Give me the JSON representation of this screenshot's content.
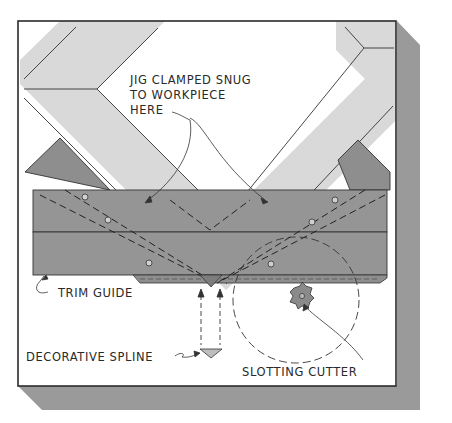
{
  "figure": {
    "type": "technical-illustration"
  },
  "colors": {
    "background": "#ffffff",
    "panel": "#ffffff",
    "panel_border": "#2b2b2b",
    "shadow": "#9a9a9a",
    "workpiece": "#d8d8d8",
    "jig_plate_back": "#8c8c8c",
    "jig_body": "#939393",
    "line": "#333333",
    "spline": "#b8b8b8"
  },
  "labels": {
    "clamp_line1": "JIG CLAMPED SNUG",
    "clamp_line2": "TO WORKPIECE",
    "clamp_line3": "HERE",
    "trim_guide": "TRIM GUIDE",
    "decorative_spline": "DECORATIVE SPLINE",
    "slotting_cutter": "SLOTTING CUTTER"
  },
  "parts": [
    {
      "name": "workpiece-left-rail",
      "description": "Light-gray mitered board, left"
    },
    {
      "name": "workpiece-right-rail",
      "description": "Light-gray mitered board, right"
    },
    {
      "name": "jig-backing-plates",
      "description": "Dark-gray angled plates behind jig"
    },
    {
      "name": "jig-body",
      "description": "Two-part horizontal jig with screws"
    },
    {
      "name": "trim-guide",
      "description": "Strip along jig bottom edge"
    },
    {
      "name": "decorative-spline",
      "description": "Triangular spline inserted into slot"
    },
    {
      "name": "slotting-cutter",
      "description": "Four-wing router slotting cutter with dashed rotation circle"
    }
  ],
  "screws": [
    {
      "x": 85,
      "y": 197
    },
    {
      "x": 108,
      "y": 220
    },
    {
      "x": 149,
      "y": 263
    },
    {
      "x": 335,
      "y": 200
    },
    {
      "x": 312,
      "y": 222
    },
    {
      "x": 271,
      "y": 264
    }
  ]
}
